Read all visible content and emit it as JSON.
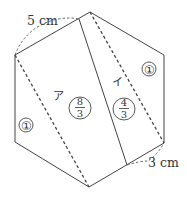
{
  "diagram": {
    "shape": "regular-hexagon",
    "colors": {
      "line": "#444444",
      "text": "#333333",
      "background": "#ffffff"
    },
    "dimensions": {
      "top_left": "5 cm",
      "bottom_right": "3 cm"
    },
    "regions": {
      "left_triangle_label": "①",
      "right_triangle_label": "①",
      "a_kana": "ア",
      "i_kana": "イ",
      "a_fraction": {
        "numerator": "8",
        "denominator": "3"
      },
      "i_fraction": {
        "numerator": "4",
        "denominator": "3"
      }
    },
    "lines": {
      "solid_cut": "solid line across hexagon from top-left edge to bottom-right edge",
      "dashed_diagonals": 2
    }
  }
}
